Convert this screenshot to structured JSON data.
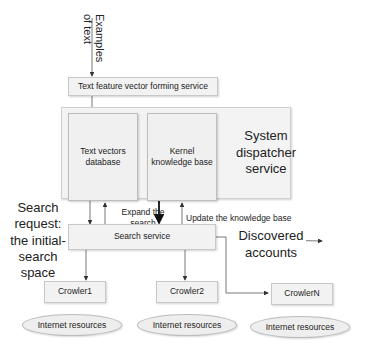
{
  "diagram": {
    "input_label": "Examples of text",
    "input_label_line1": "Examples",
    "input_label_line2": "of text",
    "feature_service": "Text feature vector forming service",
    "dispatcher": {
      "title_line1": "System",
      "title_line2": "dispatcher",
      "title_line3": "service",
      "text_vectors_db_line1": "Text vectors",
      "text_vectors_db_line2": "database",
      "kernel_kb_line1": "Kernel",
      "kernel_kb_line2": "knowledge base"
    },
    "search_request": {
      "line1": "Search",
      "line2": "request:",
      "line3": "the initial-",
      "line4": "search",
      "line5": "space"
    },
    "expand_search_line1": "Expand the",
    "expand_search_line2": "search",
    "update_kb": "Update the knowledge base",
    "search_service": "Search service",
    "discovered_line1": "Discovered",
    "discovered_line2": "accounts",
    "crawlers": [
      {
        "label": "Crowler1",
        "resource": "Internet resources"
      },
      {
        "label": "Crowler2",
        "resource": "Internet resources"
      },
      {
        "label": "CrowlerN",
        "resource": "Internet resources"
      }
    ],
    "colors": {
      "box_fill": "#f2f2f2",
      "box_border": "#c8c8c8",
      "arrow": "#333333"
    }
  }
}
